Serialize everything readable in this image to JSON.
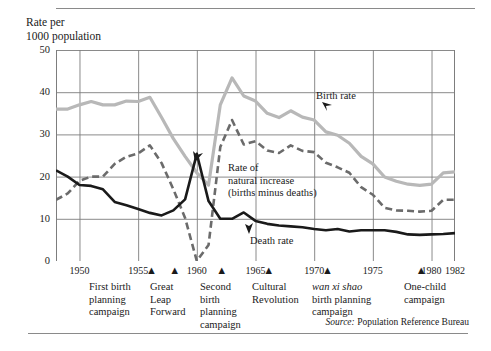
{
  "axis_title": "Rate per\n1000 population",
  "source_prefix": "Source:",
  "source_text": " Population Reference Bureau",
  "colors": {
    "birth_rate": "#b8b8b8",
    "death_rate": "#1a1a1a",
    "natural_increase": "#6b6b6b",
    "grid": "#7d7d7d",
    "text": "#1a1a1a"
  },
  "y_ticks": [
    "50",
    "40",
    "30",
    "20",
    "10",
    "0"
  ],
  "x_ticks": [
    "1950",
    "1955",
    "1960",
    "1965",
    "1970",
    "1975",
    "1980",
    "1982"
  ],
  "series_labels": {
    "birth": "Birth rate",
    "death": "Death rate",
    "natural": "Rate of\nnatural increase\n(births minus deaths)"
  },
  "events": [
    {
      "year": 1956,
      "label": "First birth\nplanning\ncampaign",
      "italic": false
    },
    {
      "year": 1958,
      "label": "Great\nLeap\nForward",
      "italic": false
    },
    {
      "year": 1962,
      "label": "Second\nbirth\nplanning\ncampaign",
      "italic": false
    },
    {
      "year": 1966,
      "label": "Cultural\nRevolution",
      "italic": false
    },
    {
      "year": 1971,
      "label": "wan xi shao",
      "label2": "birth planning\ncampaign",
      "italic": true
    },
    {
      "year": 1979,
      "label": "One-child\ncampaign",
      "italic": false
    }
  ],
  "chart_data": {
    "type": "line",
    "title": "",
    "xlabel": "",
    "ylabel": "Rate per 1000 population",
    "xlim": [
      1948,
      1982
    ],
    "ylim": [
      0,
      50
    ],
    "grid": true,
    "legend": "inline-annotations",
    "x": [
      1948,
      1949,
      1950,
      1951,
      1952,
      1953,
      1954,
      1955,
      1956,
      1957,
      1958,
      1959,
      1960,
      1961,
      1962,
      1963,
      1964,
      1965,
      1966,
      1967,
      1968,
      1969,
      1970,
      1971,
      1972,
      1973,
      1974,
      1975,
      1976,
      1977,
      1978,
      1979,
      1980,
      1981,
      1982
    ],
    "series": [
      {
        "name": "Birth rate",
        "values": [
          36,
          36,
          37,
          37.8,
          37,
          37,
          37.9,
          37.8,
          38.8,
          34,
          29,
          24.8,
          20.9,
          18,
          37,
          43.4,
          39.1,
          37.9,
          35,
          34,
          35.6,
          34.1,
          33.4,
          30.6,
          29.8,
          27.9,
          24.8,
          23,
          19.9,
          18.9,
          18.2,
          17.9,
          18.2,
          20.9,
          21.1
        ]
      },
      {
        "name": "Death rate",
        "values": [
          21.5,
          20,
          18,
          17.8,
          17,
          14,
          13.2,
          12.3,
          11.4,
          10.8,
          12,
          14.6,
          25.4,
          14.2,
          10,
          10,
          11.5,
          9.5,
          8.8,
          8.4,
          8.2,
          8,
          7.6,
          7.3,
          7.6,
          7,
          7.3,
          7.3,
          7.3,
          6.9,
          6.3,
          6.2,
          6.3,
          6.4,
          6.6
        ]
      },
      {
        "name": "Rate of natural increase (births minus deaths)",
        "values": [
          14.5,
          16,
          19,
          20,
          20,
          23,
          24.7,
          25.5,
          27.4,
          23.2,
          17,
          10.2,
          -4.5,
          3.8,
          27,
          33.4,
          27.6,
          28.4,
          26.2,
          25.6,
          27.4,
          26.1,
          25.8,
          23.3,
          22.2,
          20.9,
          17.5,
          15.7,
          12.6,
          12,
          11.9,
          11.7,
          11.9,
          14.5,
          14.5
        ]
      }
    ],
    "annotations": [
      {
        "text": "Birth rate",
        "year": 1971,
        "value": 36
      },
      {
        "text": "Death rate",
        "year": 1967,
        "value": 4
      },
      {
        "text": "Rate of natural increase (births minus deaths)",
        "year": 1964,
        "value": 20
      }
    ]
  }
}
